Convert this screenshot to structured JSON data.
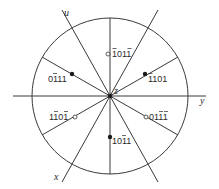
{
  "diagram": {
    "type": "stereographic-projection",
    "center": {
      "x": 110,
      "y": 96
    },
    "radius": 78,
    "axes": {
      "u": "u",
      "x": "x",
      "y": "y",
      "z": "z"
    },
    "poles": [
      {
        "label_html": "̄1011̄",
        "digits": [
          "1",
          "0",
          "1",
          "1"
        ],
        "bars": [
          true,
          false,
          false,
          true
        ],
        "filled": false,
        "x": 110,
        "y": 54
      },
      {
        "label_html": "",
        "digits": [
          "0",
          "1",
          "1",
          "1"
        ],
        "bars": [
          false,
          true,
          false,
          false
        ],
        "filled": true,
        "x": 72,
        "y": 74
      },
      {
        "label_html": "",
        "digits": [
          "1",
          "1",
          "0",
          "1"
        ],
        "bars": [
          true,
          false,
          false,
          false
        ],
        "filled": true,
        "x": 145,
        "y": 74
      },
      {
        "label_html": "",
        "digits": [
          "1",
          "1",
          "0",
          "1"
        ],
        "bars": [
          false,
          true,
          false,
          true
        ],
        "filled": false,
        "x": 74,
        "y": 117
      },
      {
        "label_html": "",
        "digits": [
          "0",
          "1",
          "1",
          "1"
        ],
        "bars": [
          false,
          false,
          true,
          true
        ],
        "filled": false,
        "x": 146,
        "y": 117
      },
      {
        "label_html": "",
        "digits": [
          "1",
          "0",
          "1",
          "1"
        ],
        "bars": [
          false,
          false,
          true,
          false
        ],
        "filled": true,
        "x": 110,
        "y": 137
      }
    ],
    "labels": {
      "p0": "1011",
      "p1": "0111",
      "p2": "1101",
      "p3": "1101",
      "p4": "0111",
      "p5": "1011"
    }
  }
}
